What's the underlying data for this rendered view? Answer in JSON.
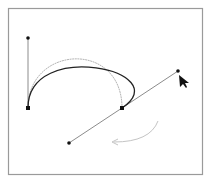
{
  "diagram": {
    "type": "bezier-curve-editing",
    "colors": {
      "frame": "#9a9a9a",
      "background": "#ffffff",
      "curve": "#222222",
      "previous_curve": "#b5b5b5",
      "handle_line": "#8c8c8c",
      "anchor": "#111111",
      "motion_arrow": "#c0c0c0",
      "cursor": "#111111"
    },
    "frame": {
      "x": 8,
      "y": 8,
      "width": 195,
      "height": 167
    },
    "anchors": [
      {
        "name": "start-anchor",
        "x": 28,
        "y": 108
      },
      {
        "name": "end-anchor",
        "x": 122,
        "y": 108
      }
    ],
    "handles": [
      {
        "name": "start-handle",
        "x": 28,
        "y": 38
      },
      {
        "name": "end-handle-out",
        "x": 178,
        "y": 71
      },
      {
        "name": "end-handle-in",
        "x": 69,
        "y": 143
      }
    ],
    "current_curve": "M28,108 C28,38 178,71 122,108",
    "previous_curve": "M28,108 C28,45 122,40 122,108",
    "motion_arrow": "M158,121 Q150,142 114,142",
    "cursor": {
      "x": 179,
      "y": 75
    }
  }
}
